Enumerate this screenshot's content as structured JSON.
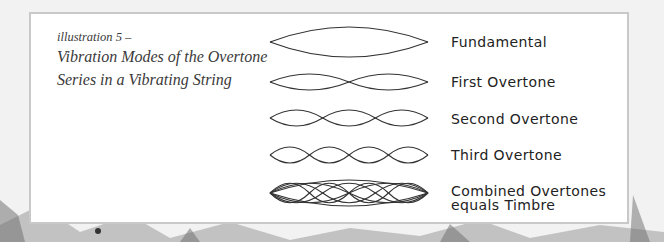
{
  "caption": {
    "label": "illustration 5 –",
    "title": "Vibration Modes of the Overtone Series in a Vibrating String"
  },
  "modes": [
    {
      "label": "Fundamental",
      "segments": 1
    },
    {
      "label": "First Overtone",
      "segments": 2
    },
    {
      "label": "Second Overtone",
      "segments": 3
    },
    {
      "label": "Third Overtone",
      "segments": 4
    },
    {
      "label": "Combined Overtones",
      "label_line2": "equals Timbre",
      "segments": [
        1,
        2,
        3,
        4
      ]
    }
  ],
  "colors": {
    "stroke": "#333333",
    "panel": "#ffffff",
    "panel_border": "#c9c9c9",
    "background": "#f3f3f3"
  }
}
